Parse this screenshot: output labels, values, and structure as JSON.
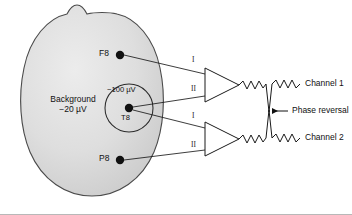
{
  "figure": {
    "background_fill": "#d9d9d9",
    "outline_color": "#444444",
    "line_color": "#1a1a1a",
    "text_color": "#111111"
  },
  "head": {
    "region_label_line1": "Background",
    "region_label_line2": "−20 µV"
  },
  "focus": {
    "amplitude_label": "−100 µV",
    "electrode_label": "T8"
  },
  "electrodes": [
    {
      "name": "F8",
      "label": "F8"
    },
    {
      "name": "T8",
      "label": "T8"
    },
    {
      "name": "P8",
      "label": "P8"
    }
  ],
  "amplifiers": [
    {
      "name": "amplifier-1",
      "input_top": "I",
      "input_bottom": "II",
      "output_label": "Channel 1",
      "spike_direction": "down"
    },
    {
      "name": "amplifier-2",
      "input_top": "I",
      "input_bottom": "II",
      "output_label": "Channel 2",
      "spike_direction": "up"
    }
  ],
  "annotations": {
    "phase_reversal": "Phase reversal"
  }
}
